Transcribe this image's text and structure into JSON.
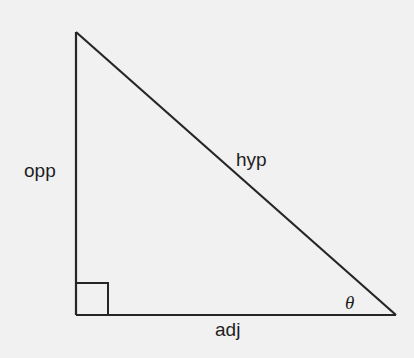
{
  "diagram": {
    "type": "right-triangle",
    "labels": {
      "opposite": "opp",
      "hypotenuse": "hyp",
      "adjacent": "adj",
      "angle": "θ"
    },
    "vertices": {
      "top": [
        76,
        32
      ],
      "right_angle": [
        76,
        315
      ],
      "angle_vertex": [
        396,
        315
      ]
    },
    "right_angle_marker_size": 32,
    "colors": {
      "background": "#f1f1f1",
      "stroke": "#262626",
      "text": "#1e1e1e"
    }
  }
}
